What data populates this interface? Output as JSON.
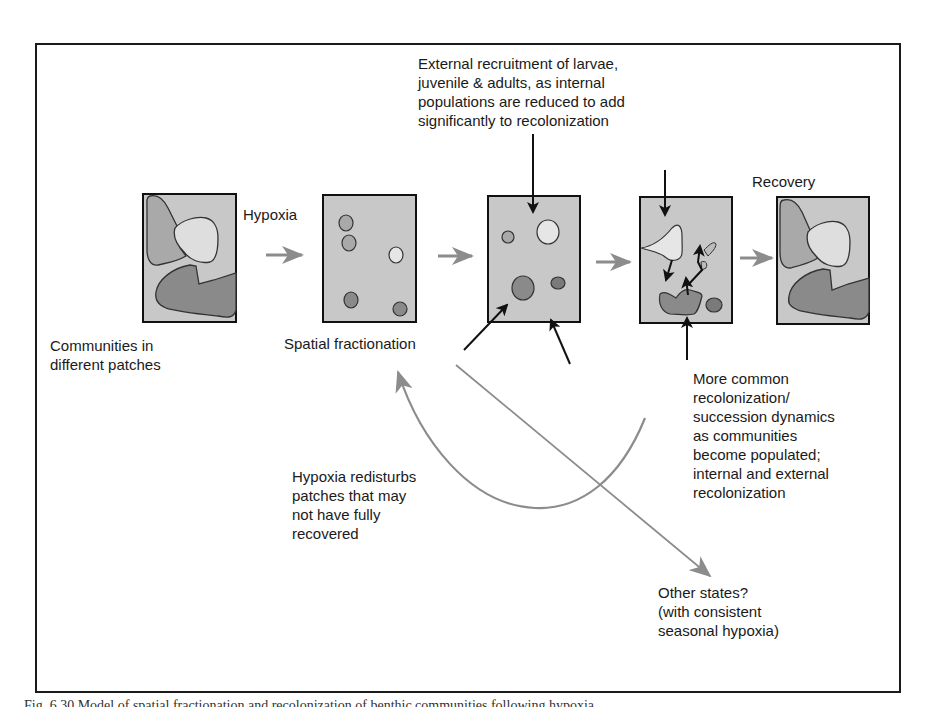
{
  "figure": {
    "caption_partial": "Fig. 6.30 Model of spatial fractionation and recolonization of benthic communities following hypoxia",
    "colors": {
      "frame": "#1a1a1a",
      "panel_fill": "#c8c8c8",
      "patch_light": "#dedede",
      "patch_mid": "#a9a9a9",
      "patch_dark": "#8a8a8a",
      "arrow_gray": "#8c8c8c",
      "arrow_black": "#111111"
    }
  },
  "panels": [
    {
      "id": "communities",
      "label": "Communities in\ndifferent patches"
    },
    {
      "id": "fractionation",
      "label": "Spatial fractionation"
    },
    {
      "id": "external-recruitment",
      "label": ""
    },
    {
      "id": "succession",
      "label": ""
    },
    {
      "id": "recovery",
      "label": "Recovery"
    }
  ],
  "labels": {
    "hypoxia": "Hypoxia",
    "external_recruitment": "External recruitment of larvae,\njuvenile & adults, as internal\npopulations are reduced to add\nsignificantly to recolonization",
    "succession": "More common\nrecolonization/\nsuccession dynamics\nas communities\nbecome populated;\ninternal and external\nrecolonization",
    "redisturb": "Hypoxia redisturbs\npatches that may\nnot have fully\nrecovered",
    "other_states": "Other states?\n(with consistent\nseasonal hypoxia)"
  }
}
